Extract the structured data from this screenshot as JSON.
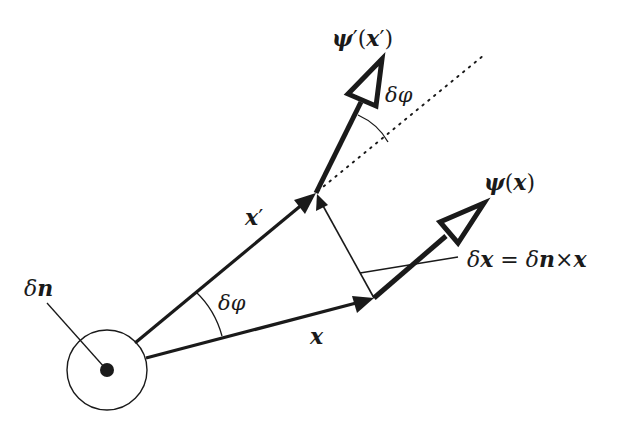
{
  "figure": {
    "colors": {
      "ink": "#1a1a1a",
      "background": "#ffffff"
    },
    "labels": {
      "psi_prime": "ψ′(x′)",
      "psi_prime_sym": "ψ",
      "psi_prime_prime": "′",
      "psi_prime_arg_open": "(",
      "psi_prime_arg": "x",
      "psi_prime_arg_prime": "′",
      "psi_prime_arg_close": ")",
      "psi": "ψ(x)",
      "psi_sym": "ψ",
      "psi_arg_open": "(",
      "psi_arg": "x",
      "psi_arg_close": ")",
      "delta_phi_top": "δφ",
      "delta_phi_origin": "δφ",
      "x_prime": "x′",
      "x_prime_sym": "x",
      "x_prime_mark": "′",
      "x": "x",
      "delta_n": "δn",
      "delta_n_delta": "δ",
      "delta_n_sym": "n",
      "delta_x_eq": "δx = δn×x",
      "dx_delta1": "δ",
      "dx_x1": "x",
      "dx_eq": " = ",
      "dx_delta2": "δ",
      "dx_n": "n",
      "dx_times": "×",
      "dx_x2": "x"
    },
    "elements": [
      {
        "name": "rotation-axis-circle",
        "center": [
          107,
          370
        ],
        "radius": 40
      },
      {
        "name": "vector-x",
        "from": [
          146,
          358
        ],
        "to": [
          374,
          298
        ]
      },
      {
        "name": "vector-x-prime",
        "from": [
          135,
          343
        ],
        "to": [
          316,
          193
        ]
      },
      {
        "name": "vector-delta-x",
        "from": [
          374,
          298
        ],
        "to": [
          316,
          193
        ]
      },
      {
        "name": "field-vector-psi",
        "from": [
          374,
          298
        ],
        "to": [
          484,
          203
        ]
      },
      {
        "name": "field-vector-psi-prime",
        "from": [
          316,
          193
        ],
        "to": [
          382,
          58
        ]
      },
      {
        "name": "dotted-reference-line",
        "from": [
          316,
          193
        ],
        "to": [
          484,
          55
        ]
      }
    ]
  }
}
